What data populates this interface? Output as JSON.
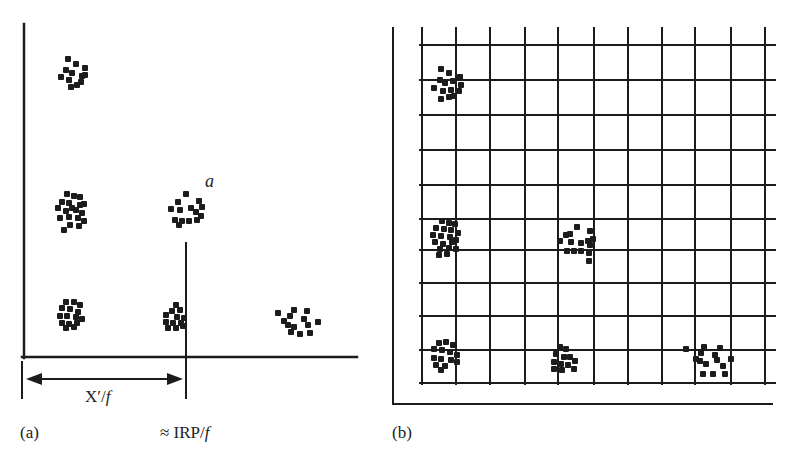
{
  "figure": {
    "panel_a": {
      "label": "(a)",
      "point_label": "a",
      "distance_label_main": "X′/",
      "distance_label_italic": "f",
      "irp_label_main": "≈ IRP/",
      "irp_label_italic": "f",
      "axes": {
        "vertical": {
          "x": 24,
          "y1": 24,
          "y2": 358
        },
        "horizontal": {
          "x1": 22,
          "x2": 357,
          "y": 357
        },
        "marker_line": {
          "x": 186,
          "y1": 243,
          "y2": 398
        },
        "left_tick": {
          "x": 22,
          "y1": 362,
          "y2": 398
        },
        "arrow": {
          "x1": 26,
          "x2": 183,
          "y": 379
        }
      },
      "clusters": [
        {
          "id": "top-left",
          "cx": 73,
          "cy": 76,
          "dots": [
            [
              -5,
              -17
            ],
            [
              3,
              -12
            ],
            [
              -7,
              -6
            ],
            [
              -1,
              -3
            ],
            [
              12,
              -8
            ],
            [
              12,
              -1
            ],
            [
              -12,
              1
            ],
            [
              -4,
              4
            ],
            [
              4,
              9
            ],
            [
              8,
              6
            ],
            [
              -2,
              11
            ],
            [
              9,
              0
            ]
          ]
        },
        {
          "id": "mid-left",
          "cx": 72,
          "cy": 211,
          "dots": [
            [
              -5,
              -17
            ],
            [
              2,
              -15
            ],
            [
              8,
              -14
            ],
            [
              -10,
              -9
            ],
            [
              -3,
              -8
            ],
            [
              8,
              -6
            ],
            [
              12,
              -7
            ],
            [
              -14,
              -3
            ],
            [
              -6,
              0
            ],
            [
              4,
              -1
            ],
            [
              10,
              2
            ],
            [
              -12,
              7
            ],
            [
              -3,
              6
            ],
            [
              6,
              7
            ],
            [
              12,
              10
            ],
            [
              -2,
              14
            ],
            [
              7,
              15
            ],
            [
              -8,
              19
            ],
            [
              0,
              -3
            ]
          ]
        },
        {
          "id": "mid-a",
          "cx": 186,
          "cy": 213,
          "dots": [
            [
              0,
              -19
            ],
            [
              -8,
              -11
            ],
            [
              13,
              -12
            ],
            [
              -15,
              -4
            ],
            [
              -6,
              -3
            ],
            [
              5,
              -5
            ],
            [
              16,
              -6
            ],
            [
              10,
              -1
            ],
            [
              -11,
              7
            ],
            [
              -4,
              8
            ],
            [
              3,
              8
            ],
            [
              11,
              7
            ],
            [
              15,
              3
            ],
            [
              -7,
              12
            ]
          ]
        },
        {
          "id": "bottom-left",
          "cx": 71,
          "cy": 315,
          "dots": [
            [
              -5,
              -13
            ],
            [
              3,
              -13
            ],
            [
              9,
              -10
            ],
            [
              -9,
              -7
            ],
            [
              -1,
              -6
            ],
            [
              7,
              -3
            ],
            [
              -11,
              1
            ],
            [
              -4,
              1
            ],
            [
              5,
              2
            ],
            [
              11,
              4
            ],
            [
              -9,
              8
            ],
            [
              -2,
              9
            ],
            [
              6,
              8
            ],
            [
              -5,
              13
            ],
            [
              3,
              12
            ]
          ]
        },
        {
          "id": "bottom-mid",
          "cx": 176,
          "cy": 317,
          "dots": [
            [
              0,
              -12
            ],
            [
              -4,
              -6
            ],
            [
              4,
              -7
            ],
            [
              -10,
              -2
            ],
            [
              1,
              0
            ],
            [
              8,
              1
            ],
            [
              -10,
              5
            ],
            [
              -3,
              6
            ],
            [
              5,
              6
            ],
            [
              -8,
              11
            ],
            [
              0,
              11
            ],
            [
              7,
              9
            ]
          ]
        },
        {
          "id": "bottom-right",
          "cx": 298,
          "cy": 324,
          "dots": [
            [
              -20,
              -11
            ],
            [
              -4,
              -14
            ],
            [
              9,
              -13
            ],
            [
              -8,
              -8
            ],
            [
              6,
              -5
            ],
            [
              -14,
              -3
            ],
            [
              -10,
              1
            ],
            [
              10,
              1
            ],
            [
              20,
              -2
            ],
            [
              -7,
              8
            ],
            [
              2,
              10
            ],
            [
              12,
              9
            ],
            [
              -4,
              3
            ]
          ]
        }
      ]
    },
    "panel_b": {
      "label": "(b)",
      "frame": {
        "x": 393,
        "y1": 28,
        "y2": 404,
        "x2": 772
      },
      "grid": {
        "xs": [
          422,
          456,
          490,
          525,
          558,
          594,
          628,
          662,
          695,
          731,
          765
        ],
        "ys": [
          45,
          80,
          115,
          150,
          185,
          219,
          250,
          283,
          316,
          350,
          383
        ],
        "v_top": 28,
        "v_bottom": 384,
        "h_left": 420,
        "h_right": 775
      },
      "clusters": [
        {
          "id": "top-left",
          "cx": 447,
          "cy": 89,
          "dots": [
            [
              -6,
              -20
            ],
            [
              2,
              -16
            ],
            [
              -7,
              -9
            ],
            [
              -2,
              -6
            ],
            [
              6,
              -8
            ],
            [
              13,
              -12
            ],
            [
              14,
              -4
            ],
            [
              -13,
              -1
            ],
            [
              -4,
              2
            ],
            [
              4,
              1
            ],
            [
              2,
              8
            ],
            [
              -6,
              10
            ],
            [
              7,
              7
            ],
            [
              12,
              2
            ]
          ]
        },
        {
          "id": "mid-left",
          "cx": 446,
          "cy": 240,
          "dots": [
            [
              -4,
              -19
            ],
            [
              3,
              -17
            ],
            [
              9,
              -16
            ],
            [
              -10,
              -12
            ],
            [
              -2,
              -11
            ],
            [
              5,
              -10
            ],
            [
              12,
              -7
            ],
            [
              -13,
              -5
            ],
            [
              -5,
              -4
            ],
            [
              4,
              -3
            ],
            [
              10,
              0
            ],
            [
              -11,
              2
            ],
            [
              -3,
              4
            ],
            [
              6,
              2
            ],
            [
              -6,
              9
            ],
            [
              3,
              8
            ],
            [
              10,
              9
            ],
            [
              -7,
              15
            ],
            [
              1,
              14
            ]
          ]
        },
        {
          "id": "mid-center",
          "cx": 577,
          "cy": 246,
          "dots": [
            [
              0,
              -19
            ],
            [
              -11,
              -11
            ],
            [
              13,
              -15
            ],
            [
              -17,
              -5
            ],
            [
              -6,
              -4
            ],
            [
              4,
              -3
            ],
            [
              11,
              -5
            ],
            [
              16,
              -7
            ],
            [
              -10,
              5
            ],
            [
              -3,
              5
            ],
            [
              4,
              5
            ],
            [
              12,
              7
            ],
            [
              13,
              -1
            ],
            [
              12,
              15
            ],
            [
              -7,
              -12
            ]
          ]
        },
        {
          "id": "bottom-left",
          "cx": 444,
          "cy": 356,
          "dots": [
            [
              -5,
              -13
            ],
            [
              2,
              -14
            ],
            [
              9,
              -11
            ],
            [
              -10,
              -7
            ],
            [
              -2,
              -6
            ],
            [
              6,
              -4
            ],
            [
              13,
              -1
            ],
            [
              -10,
              2
            ],
            [
              -3,
              3
            ],
            [
              7,
              4
            ],
            [
              13,
              6
            ],
            [
              -8,
              9
            ],
            [
              1,
              10
            ],
            [
              -3,
              14
            ]
          ]
        },
        {
          "id": "bottom-center",
          "cx": 563,
          "cy": 360,
          "dots": [
            [
              -3,
              -13
            ],
            [
              3,
              -11
            ],
            [
              -7,
              -6
            ],
            [
              1,
              -3
            ],
            [
              7,
              -3
            ],
            [
              12,
              1
            ],
            [
              -9,
              2
            ],
            [
              -2,
              4
            ],
            [
              5,
              5
            ],
            [
              -9,
              9
            ],
            [
              -1,
              10
            ],
            [
              11,
              9
            ]
          ]
        },
        {
          "id": "bottom-right",
          "cx": 710,
          "cy": 362,
          "dots": [
            [
              -24,
              -13
            ],
            [
              -6,
              -15
            ],
            [
              10,
              -14
            ],
            [
              -9,
              -9
            ],
            [
              5,
              -7
            ],
            [
              -14,
              -3
            ],
            [
              -10,
              -1
            ],
            [
              7,
              -2
            ],
            [
              13,
              4
            ],
            [
              21,
              -3
            ],
            [
              -4,
              2
            ],
            [
              -7,
              12
            ],
            [
              3,
              12
            ],
            [
              15,
              12
            ]
          ]
        }
      ]
    },
    "colors": {
      "ink": "#1c1c1c",
      "background": "#ffffff"
    }
  }
}
